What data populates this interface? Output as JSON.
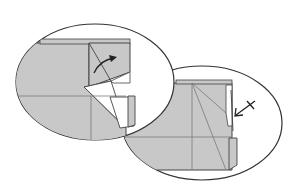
{
  "diagram": {
    "title": "Origami folding steps",
    "colors": {
      "paper": "#c8c8c8",
      "paper_white": "#ffffff",
      "line": "#333333",
      "crease": "#7a7a7a",
      "background": "#ffffff"
    },
    "steps": [
      {
        "name": "step-fold-flap-over",
        "symbol": "curved-fold-arrow"
      },
      {
        "name": "step-push-in",
        "symbol": "push-arrow-with-cross"
      }
    ]
  }
}
